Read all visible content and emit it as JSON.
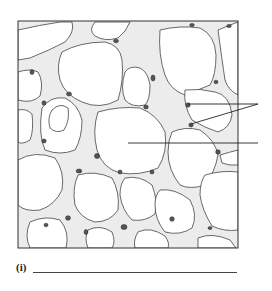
{
  "figure": {
    "label_pointers": [
      {
        "id": "pointer-a",
        "points_to": "two intercellular wall junctions (double arrow)"
      },
      {
        "id": "pointer-b",
        "points_to": "central large cell"
      }
    ]
  },
  "question": {
    "label": "(i)",
    "answer": ""
  },
  "colors": {
    "ink": "#333333",
    "wall_fill": "#e8e8e8",
    "background": "#ffffff"
  }
}
